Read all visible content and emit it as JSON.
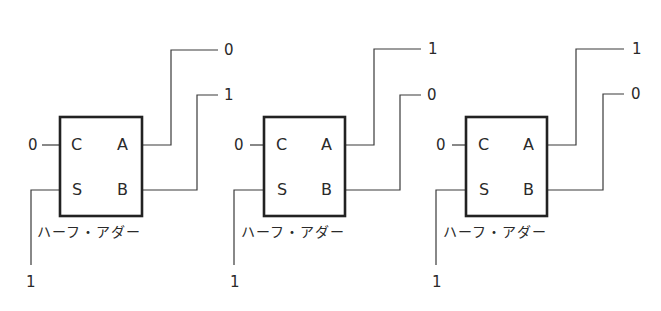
{
  "diagram": {
    "type": "half-adder-chain",
    "blocks": [
      {
        "caption": "ハーフ・アダー",
        "ports": {
          "c": "C",
          "s": "S",
          "a": "A",
          "b": "B"
        },
        "inputs": {
          "c": "0",
          "s": "1"
        },
        "outputs": {
          "a": "0",
          "b": "1"
        }
      },
      {
        "caption": "ハーフ・アダー",
        "ports": {
          "c": "C",
          "s": "S",
          "a": "A",
          "b": "B"
        },
        "inputs": {
          "c": "0",
          "s": "1"
        },
        "outputs": {
          "a": "1",
          "b": "0"
        }
      },
      {
        "caption": "ハーフ・アダー",
        "ports": {
          "c": "C",
          "s": "S",
          "a": "A",
          "b": "B"
        },
        "inputs": {
          "c": "0",
          "s": "1"
        },
        "outputs": {
          "a": "1",
          "b": "0"
        }
      }
    ]
  }
}
